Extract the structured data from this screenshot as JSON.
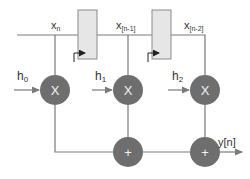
{
  "diagram": {
    "type": "FIR filter (tapped delay line)",
    "colors": {
      "line": "#7a7a7a",
      "node_fill": "#6e6e6e",
      "register_fill": "#e6e6e6",
      "register_stroke": "#8a8a8a",
      "text": "#333333",
      "op_symbol": "#f2f2f2"
    },
    "signals": {
      "x0": {
        "base": "x",
        "sub": "n"
      },
      "x1": {
        "base": "x",
        "sub": "[n-1]"
      },
      "x2": {
        "base": "x",
        "sub": "[n-2]"
      }
    },
    "coefficients": [
      {
        "base": "h",
        "sub": "0"
      },
      {
        "base": "h",
        "sub": "1"
      },
      {
        "base": "h",
        "sub": "2"
      }
    ],
    "multipliers": [
      {
        "symbol": "X"
      },
      {
        "symbol": "X"
      },
      {
        "symbol": "X"
      }
    ],
    "adders": [
      {
        "symbol": "+"
      },
      {
        "symbol": "+"
      }
    ],
    "registers": [
      {
        "name": "delay-register-1"
      },
      {
        "name": "delay-register-2"
      }
    ],
    "output": {
      "label": "y[n]"
    }
  }
}
